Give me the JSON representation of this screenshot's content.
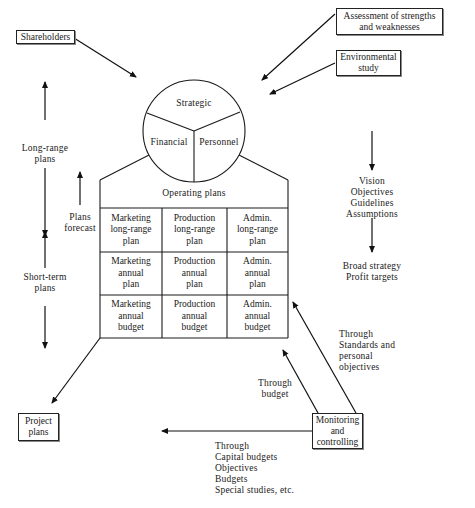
{
  "boxes": {
    "shareholders": "Shareholders",
    "assessment": [
      "Assessment of strengths",
      "and weaknesses"
    ],
    "environmental": [
      "Environmental",
      "study"
    ],
    "project_plans": [
      "Project",
      "plans"
    ],
    "monitoring": [
      "Monitoring",
      "and",
      "controlling"
    ]
  },
  "circle": {
    "strategic": "Strategic",
    "financial": "Financial",
    "personnel": "Personnel"
  },
  "operating": {
    "title": "Operating plans",
    "grid": [
      [
        [
          "Marketing",
          "long-range",
          "plan"
        ],
        [
          "Production",
          "long-range",
          "plan"
        ],
        [
          "Admin.",
          "long-range",
          "plan"
        ]
      ],
      [
        [
          "Marketing",
          "annual",
          "plan"
        ],
        [
          "Production",
          "annual",
          "plan"
        ],
        [
          "Admin.",
          "annual",
          "plan"
        ]
      ],
      [
        [
          "Marketing",
          "annual",
          "budget"
        ],
        [
          "Production",
          "annual",
          "budget"
        ],
        [
          "Admin.",
          "annual",
          "budget"
        ]
      ]
    ]
  },
  "labels": {
    "long_range": [
      "Long-range",
      "plans"
    ],
    "short_term": [
      "Short-term",
      "plans"
    ],
    "plans_forecast": [
      "Plans",
      "forecast"
    ],
    "vision_list": [
      "Vision",
      "Objectives",
      "Guidelines",
      "Assumptions"
    ],
    "broad_strategy": [
      "Broad strategy",
      "Profit targets"
    ],
    "through_standards": [
      "Through",
      "Standards and",
      "personal",
      "objectives"
    ],
    "through_budget": [
      "Through",
      "budget"
    ],
    "through_capital": [
      "Through",
      "Capital budgets",
      "Objectives",
      "Budgets",
      "Special studies, etc."
    ]
  }
}
